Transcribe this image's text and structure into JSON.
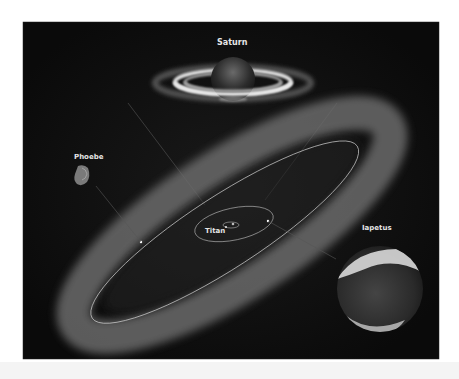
{
  "figure": {
    "background_color": "#0b0b0b",
    "frame_color": "#ffffff",
    "labels": {
      "saturn": "Saturn",
      "phoebe": "Phoebe",
      "titan": "Titan",
      "iapetus": "Iapetus"
    }
  }
}
